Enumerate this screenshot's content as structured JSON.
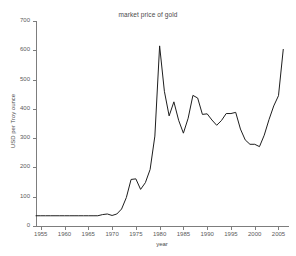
{
  "chart_data": {
    "type": "line",
    "title": "market price of gold",
    "xlabel": "year",
    "ylabel": "USD per Troy ounce",
    "xlim": [
      1954,
      2007
    ],
    "ylim": [
      0,
      700
    ],
    "xticks": [
      1955,
      1960,
      1965,
      1970,
      1975,
      1980,
      1985,
      1990,
      1995,
      2000,
      2005
    ],
    "yticks": [
      0,
      100,
      200,
      300,
      400,
      500,
      600,
      700
    ],
    "grid": false,
    "legend": false,
    "legend_position": "none",
    "series": [
      {
        "name": "market price of gold",
        "color": "#1e1e1e",
        "x": [
          1954,
          1955,
          1956,
          1957,
          1958,
          1959,
          1960,
          1961,
          1962,
          1963,
          1964,
          1965,
          1966,
          1967,
          1968,
          1969,
          1970,
          1971,
          1972,
          1973,
          1974,
          1975,
          1976,
          1977,
          1978,
          1979,
          1980,
          1981,
          1982,
          1983,
          1984,
          1985,
          1986,
          1987,
          1988,
          1989,
          1990,
          1991,
          1992,
          1993,
          1994,
          1995,
          1996,
          1997,
          1998,
          1999,
          2000,
          2001,
          2002,
          2003,
          2004,
          2005,
          2006
        ],
        "values": [
          35,
          35,
          35,
          35,
          35,
          35,
          35,
          35,
          35,
          35,
          35,
          35,
          35,
          35,
          39,
          41,
          36,
          41,
          58,
          97,
          159,
          161,
          125,
          148,
          193,
          307,
          615,
          460,
          376,
          424,
          361,
          317,
          368,
          446,
          437,
          381,
          383,
          362,
          344,
          360,
          384,
          384,
          388,
          331,
          294,
          279,
          279,
          271,
          310,
          363,
          410,
          445,
          603
        ]
      }
    ]
  }
}
